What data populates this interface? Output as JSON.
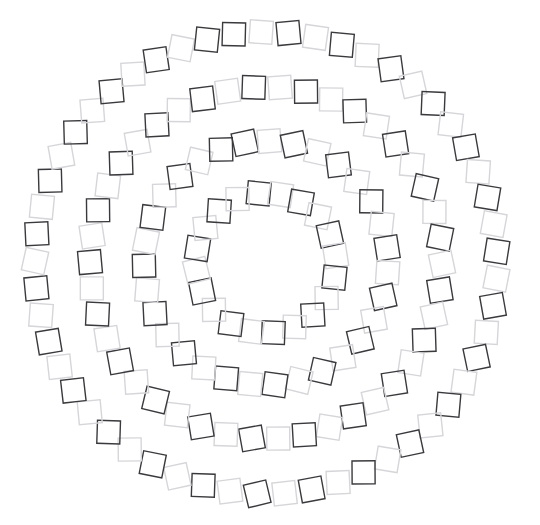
{
  "figure": {
    "title": "",
    "background_color": "#ffffff",
    "width": 540,
    "height": 525
  },
  "chart_data": {
    "type": "scatter",
    "title": "",
    "subtitle": "",
    "xlabel": "",
    "ylabel": "",
    "xlim": [
      0,
      540
    ],
    "ylim": [
      0,
      525
    ],
    "grid": false,
    "legend": null,
    "annotations": [],
    "marker": {
      "shape": "square",
      "fill": "none",
      "size_px": 23,
      "stroke_width": 1.4,
      "rotation_jitter_deg": 14
    },
    "palette": {
      "dark": "#3a3a3e",
      "light": "#d6d6da",
      "background": "#ffffff"
    },
    "center": {
      "x": 266,
      "y": 263
    },
    "series": [
      {
        "name": "ring-1-inner",
        "radius": 70,
        "count": 20,
        "start_angle_deg": -96,
        "colors": [
          "dark",
          "light"
        ]
      },
      {
        "name": "ring-2",
        "radius": 122,
        "count": 31,
        "start_angle_deg": -100,
        "colors": [
          "dark",
          "light"
        ]
      },
      {
        "name": "ring-3",
        "radius": 176,
        "count": 42,
        "start_angle_deg": -94,
        "colors": [
          "dark",
          "light"
        ]
      },
      {
        "name": "ring-4-outer",
        "radius": 231,
        "count": 53,
        "start_angle_deg": -98,
        "colors": [
          "dark",
          "light"
        ]
      }
    ]
  }
}
